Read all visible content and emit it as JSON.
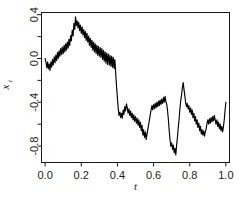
{
  "figure": {
    "background_color": "#ffffff",
    "line_color": "#000000",
    "axis_color": "#1a1a1a",
    "caption_fragment": ""
  },
  "chart_data": {
    "type": "line",
    "title": "",
    "subtitle": "",
    "xlabel": "t",
    "ylabel": "x_t",
    "ylabel_display": "x",
    "ylabel_subscript": "t",
    "xlim": [
      -0.02,
      1.02
    ],
    "ylim": [
      -0.95,
      0.42
    ],
    "xticks": [
      0.0,
      0.2,
      0.4,
      0.6,
      0.8,
      1.0
    ],
    "xtick_labels": [
      "0.0",
      "0.2",
      "0.4",
      "0.6",
      "0.8",
      "1.0"
    ],
    "yticks": [
      0.4,
      0.0,
      -0.4,
      -0.8
    ],
    "ytick_labels": [
      "0.4",
      "0.0",
      "-0.4",
      "-0.8"
    ],
    "yticks_minor": [
      0.2,
      -0.2,
      -0.6
    ],
    "grid": false,
    "legend": null,
    "series": [
      {
        "name": "brownian-path",
        "color": "#000000",
        "x": [
          0.0,
          0.004,
          0.008,
          0.012,
          0.016,
          0.02,
          0.024,
          0.028,
          0.032,
          0.036,
          0.04,
          0.044,
          0.048,
          0.052,
          0.056,
          0.06,
          0.064,
          0.068,
          0.072,
          0.076,
          0.08,
          0.084,
          0.088,
          0.092,
          0.096,
          0.1,
          0.104,
          0.108,
          0.112,
          0.116,
          0.12,
          0.124,
          0.128,
          0.132,
          0.136,
          0.14,
          0.144,
          0.148,
          0.152,
          0.156,
          0.16,
          0.164,
          0.168,
          0.172,
          0.176,
          0.18,
          0.184,
          0.188,
          0.192,
          0.196,
          0.2,
          0.204,
          0.208,
          0.212,
          0.216,
          0.22,
          0.224,
          0.228,
          0.232,
          0.236,
          0.24,
          0.244,
          0.248,
          0.252,
          0.256,
          0.26,
          0.264,
          0.268,
          0.272,
          0.276,
          0.28,
          0.284,
          0.288,
          0.292,
          0.296,
          0.3,
          0.304,
          0.308,
          0.312,
          0.316,
          0.32,
          0.324,
          0.328,
          0.332,
          0.336,
          0.34,
          0.344,
          0.348,
          0.352,
          0.356,
          0.36,
          0.364,
          0.368,
          0.372,
          0.376,
          0.38,
          0.384,
          0.388,
          0.392,
          0.396,
          0.4,
          0.404,
          0.408,
          0.412,
          0.416,
          0.42,
          0.424,
          0.428,
          0.432,
          0.436,
          0.44,
          0.444,
          0.448,
          0.452,
          0.456,
          0.46,
          0.464,
          0.468,
          0.472,
          0.476,
          0.48,
          0.484,
          0.488,
          0.492,
          0.496,
          0.5,
          0.504,
          0.508,
          0.512,
          0.516,
          0.52,
          0.524,
          0.528,
          0.532,
          0.536,
          0.54,
          0.544,
          0.548,
          0.552,
          0.556,
          0.56,
          0.564,
          0.568,
          0.572,
          0.576,
          0.58,
          0.584,
          0.588,
          0.592,
          0.596,
          0.6,
          0.604,
          0.608,
          0.612,
          0.616,
          0.62,
          0.624,
          0.628,
          0.632,
          0.636,
          0.64,
          0.644,
          0.648,
          0.652,
          0.656,
          0.66,
          0.664,
          0.668,
          0.672,
          0.676,
          0.68,
          0.684,
          0.688,
          0.692,
          0.696,
          0.7,
          0.704,
          0.708,
          0.712,
          0.716,
          0.72,
          0.724,
          0.728,
          0.732,
          0.736,
          0.74,
          0.744,
          0.748,
          0.752,
          0.756,
          0.76,
          0.764,
          0.768,
          0.772,
          0.776,
          0.78,
          0.784,
          0.788,
          0.792,
          0.796,
          0.8,
          0.804,
          0.808,
          0.812,
          0.816,
          0.82,
          0.824,
          0.828,
          0.832,
          0.836,
          0.84,
          0.844,
          0.848,
          0.852,
          0.856,
          0.86,
          0.864,
          0.868,
          0.872,
          0.876,
          0.88,
          0.884,
          0.888,
          0.892,
          0.896,
          0.9,
          0.904,
          0.908,
          0.912,
          0.916,
          0.92,
          0.924,
          0.928,
          0.932,
          0.936,
          0.94,
          0.944,
          0.948,
          0.952,
          0.956,
          0.96,
          0.964,
          0.968,
          0.972,
          0.976,
          0.98,
          0.984,
          0.988,
          0.992,
          0.996,
          1.0
        ],
        "y": [
          0.0,
          -0.03,
          -0.075,
          -0.045,
          -0.1,
          -0.06,
          -0.11,
          -0.055,
          -0.095,
          -0.04,
          -0.085,
          -0.02,
          -0.06,
          0.01,
          -0.035,
          0.03,
          -0.02,
          0.04,
          -0.01,
          0.055,
          0.01,
          0.07,
          0.025,
          0.085,
          0.03,
          0.095,
          0.04,
          0.105,
          0.05,
          0.12,
          0.06,
          0.135,
          0.08,
          0.15,
          0.095,
          0.175,
          0.12,
          0.2,
          0.15,
          0.23,
          0.18,
          0.26,
          0.215,
          0.29,
          0.25,
          0.32,
          0.28,
          0.355,
          0.31,
          0.38,
          0.33,
          0.355,
          0.3,
          0.34,
          0.285,
          0.31,
          0.255,
          0.285,
          0.23,
          0.26,
          0.205,
          0.235,
          0.175,
          0.21,
          0.155,
          0.185,
          0.13,
          0.165,
          0.11,
          0.15,
          0.1,
          0.135,
          0.075,
          0.12,
          0.055,
          0.095,
          0.03,
          0.07,
          0.01,
          0.05,
          -0.01,
          0.035,
          -0.03,
          0.06,
          0.015,
          0.09,
          0.04,
          0.12,
          0.07,
          0.15,
          0.11,
          0.175,
          0.135,
          0.2,
          0.16,
          0.215,
          0.17,
          0.195,
          0.14,
          0.175,
          0.12,
          0.15,
          0.09,
          0.13,
          0.095,
          0.145,
          0.11,
          0.16,
          0.12,
          0.17,
          0.135,
          0.175,
          0.14,
          0.165,
          0.125,
          0.155,
          0.11,
          0.14,
          0.095,
          0.125,
          0.08,
          0.11,
          0.065,
          0.1,
          0.055,
          0.085,
          0.04,
          0.07,
          0.025,
          0.055,
          0.01,
          0.04,
          -0.005,
          0.025,
          -0.02,
          0.01,
          -0.035,
          -0.005,
          -0.05,
          -0.02,
          -0.065,
          -0.035,
          -0.08,
          -0.05,
          -0.095,
          -0.065,
          -0.11,
          -0.08,
          -0.13,
          -0.1,
          -0.15,
          -0.115,
          -0.165,
          -0.135,
          -0.185,
          -0.155,
          -0.175,
          -0.15,
          -0.18,
          -0.16,
          -0.2,
          -0.175,
          -0.215,
          -0.19,
          -0.23,
          -0.2,
          -0.225,
          -0.195,
          -0.215,
          -0.185,
          -0.205,
          -0.175,
          -0.195,
          -0.165,
          -0.19,
          -0.16,
          -0.185,
          -0.155,
          -0.18,
          -0.15,
          -0.175,
          -0.145,
          -0.17,
          -0.14,
          -0.165,
          -0.135,
          -0.16,
          -0.13,
          -0.155,
          -0.12,
          -0.145,
          -0.115,
          -0.14,
          -0.11,
          -0.135,
          -0.105,
          -0.13,
          -0.1,
          -0.125,
          -0.095,
          -0.12,
          -0.09,
          -0.115,
          -0.085,
          -0.11,
          -0.08,
          -0.105,
          -0.075,
          -0.1,
          -0.07,
          -0.095,
          -0.065,
          -0.09,
          -0.06,
          -0.085,
          -0.055,
          -0.08,
          -0.05,
          -0.075,
          -0.045,
          -0.07,
          -0.04,
          -0.065,
          -0.035,
          -0.06,
          -0.03,
          -0.055,
          -0.025,
          -0.05,
          -0.02,
          -0.045,
          -0.015,
          -0.04,
          -0.01,
          -0.035,
          -0.005,
          -0.03,
          0.0,
          -0.025,
          0.005,
          -0.02,
          0.01,
          -0.015,
          0.015,
          -0.01,
          0.02,
          -0.005,
          0.025,
          0.0,
          0.03,
          0.035
        ]
      }
    ],
    "path_points": [
      [
        0.0,
        0.0
      ],
      [
        0.005,
        -0.04
      ],
      [
        0.01,
        -0.085
      ],
      [
        0.014,
        -0.03
      ],
      [
        0.018,
        -0.095
      ],
      [
        0.023,
        -0.05
      ],
      [
        0.027,
        -0.11
      ],
      [
        0.032,
        -0.03
      ],
      [
        0.036,
        -0.08
      ],
      [
        0.041,
        -0.01
      ],
      [
        0.045,
        -0.06
      ],
      [
        0.05,
        0.015
      ],
      [
        0.055,
        -0.04
      ],
      [
        0.059,
        0.03
      ],
      [
        0.064,
        -0.02
      ],
      [
        0.068,
        0.055
      ],
      [
        0.073,
        0.0
      ],
      [
        0.077,
        0.07
      ],
      [
        0.082,
        0.02
      ],
      [
        0.086,
        0.09
      ],
      [
        0.091,
        0.035
      ],
      [
        0.095,
        0.105
      ],
      [
        0.1,
        0.045
      ],
      [
        0.105,
        0.12
      ],
      [
        0.109,
        0.06
      ],
      [
        0.114,
        0.135
      ],
      [
        0.118,
        0.075
      ],
      [
        0.123,
        0.15
      ],
      [
        0.127,
        0.095
      ],
      [
        0.132,
        0.175
      ],
      [
        0.136,
        0.12
      ],
      [
        0.141,
        0.21
      ],
      [
        0.145,
        0.16
      ],
      [
        0.15,
        0.26
      ],
      [
        0.155,
        0.205
      ],
      [
        0.159,
        0.32
      ],
      [
        0.164,
        0.265
      ],
      [
        0.168,
        0.38
      ],
      [
        0.173,
        0.3
      ],
      [
        0.177,
        0.345
      ],
      [
        0.182,
        0.28
      ],
      [
        0.186,
        0.33
      ],
      [
        0.191,
        0.255
      ],
      [
        0.195,
        0.305
      ],
      [
        0.2,
        0.23
      ],
      [
        0.205,
        0.29
      ],
      [
        0.209,
        0.215
      ],
      [
        0.214,
        0.265
      ],
      [
        0.218,
        0.19
      ],
      [
        0.223,
        0.245
      ],
      [
        0.227,
        0.165
      ],
      [
        0.232,
        0.23
      ],
      [
        0.236,
        0.15
      ],
      [
        0.241,
        0.205
      ],
      [
        0.245,
        0.12
      ],
      [
        0.25,
        0.185
      ],
      [
        0.255,
        0.1
      ],
      [
        0.259,
        0.165
      ],
      [
        0.264,
        0.075
      ],
      [
        0.268,
        0.15
      ],
      [
        0.273,
        0.06
      ],
      [
        0.277,
        0.135
      ],
      [
        0.282,
        0.045
      ],
      [
        0.286,
        0.12
      ],
      [
        0.291,
        0.03
      ],
      [
        0.295,
        0.11
      ],
      [
        0.3,
        0.02
      ],
      [
        0.305,
        0.1
      ],
      [
        0.309,
        0.01
      ],
      [
        0.314,
        0.09
      ],
      [
        0.318,
        -0.01
      ],
      [
        0.323,
        0.075
      ],
      [
        0.327,
        -0.025
      ],
      [
        0.332,
        0.06
      ],
      [
        0.336,
        -0.04
      ],
      [
        0.341,
        0.05
      ],
      [
        0.345,
        -0.055
      ],
      [
        0.35,
        0.04
      ],
      [
        0.355,
        -0.06
      ],
      [
        0.359,
        0.03
      ],
      [
        0.364,
        -0.07
      ],
      [
        0.368,
        0.02
      ],
      [
        0.373,
        -0.08
      ],
      [
        0.377,
        0.01
      ],
      [
        0.382,
        -0.09
      ],
      [
        0.386,
        -0.01
      ],
      [
        0.391,
        -0.15
      ],
      [
        0.395,
        -0.25
      ],
      [
        0.4,
        -0.36
      ],
      [
        0.405,
        -0.47
      ],
      [
        0.409,
        -0.52
      ],
      [
        0.414,
        -0.49
      ],
      [
        0.418,
        -0.54
      ],
      [
        0.423,
        -0.5
      ],
      [
        0.427,
        -0.545
      ],
      [
        0.432,
        -0.47
      ],
      [
        0.436,
        -0.51
      ],
      [
        0.441,
        -0.44
      ],
      [
        0.445,
        -0.48
      ],
      [
        0.45,
        -0.415
      ],
      [
        0.455,
        -0.455
      ],
      [
        0.459,
        -0.5
      ],
      [
        0.464,
        -0.46
      ],
      [
        0.468,
        -0.52
      ],
      [
        0.473,
        -0.48
      ],
      [
        0.477,
        -0.54
      ],
      [
        0.482,
        -0.5
      ],
      [
        0.486,
        -0.56
      ],
      [
        0.491,
        -0.515
      ],
      [
        0.495,
        -0.575
      ],
      [
        0.5,
        -0.53
      ],
      [
        0.505,
        -0.59
      ],
      [
        0.509,
        -0.545
      ],
      [
        0.514,
        -0.61
      ],
      [
        0.518,
        -0.56
      ],
      [
        0.523,
        -0.63
      ],
      [
        0.527,
        -0.58
      ],
      [
        0.532,
        -0.66
      ],
      [
        0.536,
        -0.61
      ],
      [
        0.541,
        -0.7
      ],
      [
        0.545,
        -0.65
      ],
      [
        0.55,
        -0.72
      ],
      [
        0.555,
        -0.67
      ],
      [
        0.559,
        -0.74
      ],
      [
        0.564,
        -0.69
      ],
      [
        0.568,
        -0.65
      ],
      [
        0.573,
        -0.6
      ],
      [
        0.577,
        -0.56
      ],
      [
        0.582,
        -0.51
      ],
      [
        0.586,
        -0.47
      ],
      [
        0.591,
        -0.43
      ],
      [
        0.595,
        -0.47
      ],
      [
        0.6,
        -0.42
      ],
      [
        0.605,
        -0.46
      ],
      [
        0.609,
        -0.41
      ],
      [
        0.614,
        -0.45
      ],
      [
        0.618,
        -0.4
      ],
      [
        0.623,
        -0.44
      ],
      [
        0.627,
        -0.39
      ],
      [
        0.632,
        -0.43
      ],
      [
        0.636,
        -0.38
      ],
      [
        0.641,
        -0.42
      ],
      [
        0.645,
        -0.37
      ],
      [
        0.65,
        -0.41
      ],
      [
        0.655,
        -0.355
      ],
      [
        0.659,
        -0.4
      ],
      [
        0.664,
        -0.345
      ],
      [
        0.668,
        -0.395
      ],
      [
        0.673,
        -0.42
      ],
      [
        0.677,
        -0.47
      ],
      [
        0.682,
        -0.56
      ],
      [
        0.686,
        -0.65
      ],
      [
        0.691,
        -0.74
      ],
      [
        0.695,
        -0.8
      ],
      [
        0.7,
        -0.77
      ],
      [
        0.705,
        -0.83
      ],
      [
        0.709,
        -0.79
      ],
      [
        0.714,
        -0.86
      ],
      [
        0.718,
        -0.82
      ],
      [
        0.723,
        -0.88
      ],
      [
        0.727,
        -0.8
      ],
      [
        0.732,
        -0.72
      ],
      [
        0.736,
        -0.64
      ],
      [
        0.741,
        -0.56
      ],
      [
        0.745,
        -0.47
      ],
      [
        0.75,
        -0.39
      ],
      [
        0.755,
        -0.33
      ],
      [
        0.759,
        -0.27
      ],
      [
        0.764,
        -0.22
      ],
      [
        0.768,
        -0.28
      ],
      [
        0.773,
        -0.34
      ],
      [
        0.777,
        -0.4
      ],
      [
        0.782,
        -0.44
      ],
      [
        0.786,
        -0.41
      ],
      [
        0.791,
        -0.46
      ],
      [
        0.795,
        -0.43
      ],
      [
        0.8,
        -0.49
      ],
      [
        0.805,
        -0.45
      ],
      [
        0.809,
        -0.51
      ],
      [
        0.814,
        -0.47
      ],
      [
        0.818,
        -0.54
      ],
      [
        0.823,
        -0.5
      ],
      [
        0.827,
        -0.57
      ],
      [
        0.832,
        -0.53
      ],
      [
        0.836,
        -0.6
      ],
      [
        0.841,
        -0.56
      ],
      [
        0.845,
        -0.63
      ],
      [
        0.85,
        -0.59
      ],
      [
        0.855,
        -0.66
      ],
      [
        0.859,
        -0.62
      ],
      [
        0.864,
        -0.69
      ],
      [
        0.868,
        -0.65
      ],
      [
        0.873,
        -0.7
      ],
      [
        0.877,
        -0.66
      ],
      [
        0.882,
        -0.71
      ],
      [
        0.886,
        -0.67
      ],
      [
        0.891,
        -0.64
      ],
      [
        0.895,
        -0.6
      ],
      [
        0.9,
        -0.56
      ],
      [
        0.905,
        -0.6
      ],
      [
        0.909,
        -0.55
      ],
      [
        0.914,
        -0.59
      ],
      [
        0.918,
        -0.54
      ],
      [
        0.923,
        -0.58
      ],
      [
        0.927,
        -0.53
      ],
      [
        0.932,
        -0.57
      ],
      [
        0.936,
        -0.52
      ],
      [
        0.941,
        -0.56
      ],
      [
        0.945,
        -0.6
      ],
      [
        0.95,
        -0.56
      ],
      [
        0.955,
        -0.62
      ],
      [
        0.959,
        -0.58
      ],
      [
        0.964,
        -0.64
      ],
      [
        0.968,
        -0.6
      ],
      [
        0.973,
        -0.66
      ],
      [
        0.977,
        -0.62
      ],
      [
        0.982,
        -0.67
      ],
      [
        0.986,
        -0.63
      ],
      [
        0.991,
        -0.56
      ],
      [
        0.995,
        -0.48
      ],
      [
        1.0,
        -0.4
      ]
    ]
  }
}
